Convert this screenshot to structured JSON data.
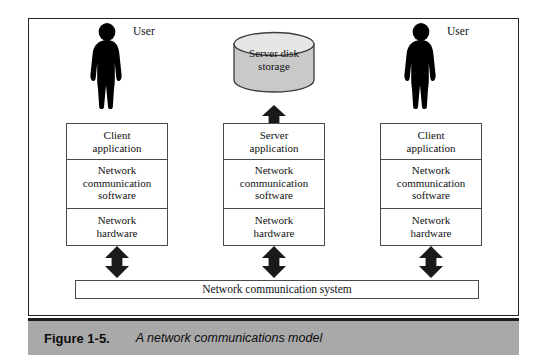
{
  "figure": {
    "caption_number": "Figure 1-5.",
    "caption_title": "A network communications model",
    "bus_label": "Network communication system",
    "colors": {
      "frame_border": "#242424",
      "box_border": "#4a4a4a",
      "caption_background": "#a9a9a9",
      "silhouette": "#000000",
      "cylinder_body": "#c9c9c9",
      "cylinder_top": "#e4e4e4",
      "arrow": "#1a1a1a"
    },
    "columns": [
      {
        "id": "client-left",
        "top_node": {
          "type": "user",
          "icon": "user-silhouette-icon",
          "label": "User"
        },
        "stack": [
          {
            "line1": "Client",
            "line2": "application"
          },
          {
            "line1": "Network",
            "line2": "communication",
            "line3": "software"
          },
          {
            "line1": "Network",
            "line2": "hardware"
          }
        ],
        "arrow_top": null,
        "arrow_bottom": {
          "icon": "double-arrow-vertical-icon"
        }
      },
      {
        "id": "server",
        "top_node": {
          "type": "disk",
          "icon": "database-cylinder-icon",
          "line1": "Server disk",
          "line2": "storage"
        },
        "stack": [
          {
            "line1": "Server",
            "line2": "application"
          },
          {
            "line1": "Network",
            "line2": "communication",
            "line3": "software"
          },
          {
            "line1": "Network",
            "line2": "hardware"
          }
        ],
        "arrow_top": {
          "icon": "double-arrow-vertical-icon"
        },
        "arrow_bottom": {
          "icon": "double-arrow-vertical-icon"
        }
      },
      {
        "id": "client-right",
        "top_node": {
          "type": "user",
          "icon": "user-silhouette-icon",
          "label": "User"
        },
        "stack": [
          {
            "line1": "Client",
            "line2": "application"
          },
          {
            "line1": "Network",
            "line2": "communication",
            "line3": "software"
          },
          {
            "line1": "Network",
            "line2": "hardware"
          }
        ],
        "arrow_top": null,
        "arrow_bottom": {
          "icon": "double-arrow-vertical-icon"
        }
      }
    ]
  }
}
